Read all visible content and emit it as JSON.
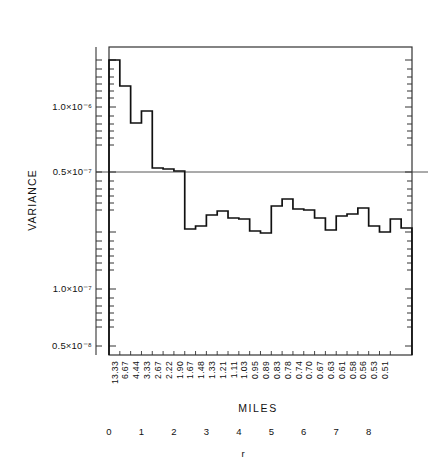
{
  "figure": {
    "background_color": "#ffffff",
    "line_color": "#111111",
    "axis_color": "#333333"
  },
  "axes": {
    "y_axis_title": "VARIANCE",
    "x_axis_title": "MILES",
    "secondary_x_axis_title": "r"
  },
  "chart_data": {
    "type": "line",
    "title": "",
    "subtitle": "",
    "xlabel": "MILES",
    "ylabel": "VARIANCE",
    "secondary_xlabel": "r",
    "grid": false,
    "legend": "none",
    "y_scale": "log",
    "y_tick_labels": [
      "1.0×10⁻⁶",
      "0.5×10⁻⁷",
      "1.0×10⁻⁷",
      "0.5×10⁻⁸"
    ],
    "y_tick_positions": [
      107,
      172,
      289,
      346
    ],
    "reference_line_label": "0.5×10⁻⁷",
    "x_tick_labels_miles": [
      "13.33",
      "6.67",
      "4.44",
      "3.33",
      "2.67",
      "2.22",
      "1.90",
      "1.67",
      "1.48",
      "1.33",
      "1.21",
      "1.11",
      "1.03",
      "0.95",
      "0.89",
      "0.83",
      "0.78",
      "0.74",
      "0.70",
      "0.67",
      "0.63",
      "0.61",
      "0.58",
      "0.56",
      "0.53",
      "0.51"
    ],
    "x_tick_labels_r": [
      "0",
      "1",
      "2",
      "3",
      "4",
      "5",
      "6",
      "7",
      "8"
    ],
    "series": [
      {
        "name": "variance",
        "step_values_px": [
          60,
          86,
          123,
          111,
          168,
          169,
          171,
          229,
          226,
          215,
          211,
          218,
          219,
          231,
          233,
          206,
          199,
          209,
          210,
          218,
          230,
          216,
          214,
          208,
          226,
          232,
          219,
          228
        ]
      }
    ]
  },
  "plot_geometry": {
    "left": 109,
    "right": 412,
    "top": 47,
    "bottom": 355,
    "baseline_y": 172,
    "step_width": 10.82
  }
}
